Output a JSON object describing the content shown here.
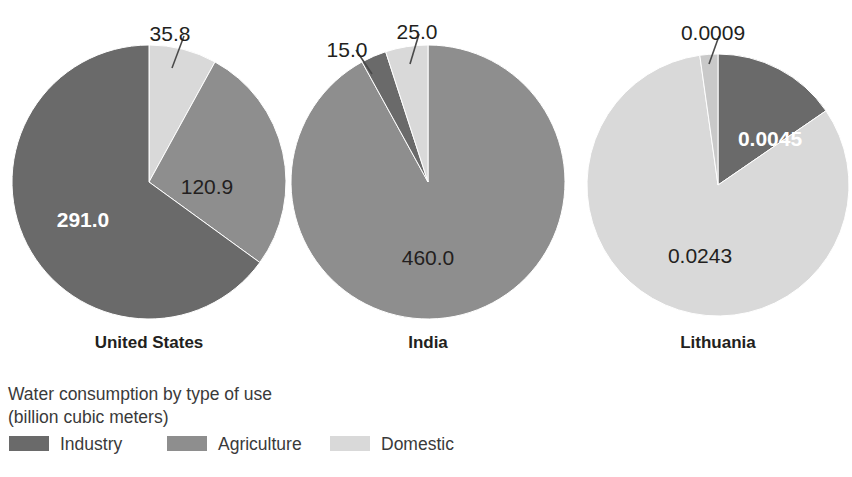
{
  "chart_data": {
    "type": "pie",
    "title": "Water consumption by type of use",
    "subtitle": "(billion cubic meters)",
    "unit": "billion cubic meters",
    "legend": {
      "position": "bottom-left",
      "entries": [
        {
          "name": "Industry",
          "color": "#6a6a6a"
        },
        {
          "name": "Agriculture",
          "color": "#8e8e8e"
        },
        {
          "name": "Domestic",
          "color": "#d9d9d9"
        }
      ]
    },
    "charts": [
      {
        "title": "United States",
        "categories": [
          "Industry",
          "Agriculture",
          "Domestic"
        ],
        "values": [
          291.0,
          120.9,
          35.8
        ],
        "labels": [
          "291.0",
          "120.9",
          "35.8"
        ]
      },
      {
        "title": "India",
        "categories": [
          "Industry",
          "Agriculture",
          "Domestic"
        ],
        "values": [
          15.0,
          460.0,
          25.0
        ],
        "labels": [
          "15.0",
          "460.0",
          "25.0"
        ]
      },
      {
        "title": "Lithuania",
        "categories": [
          "Industry",
          "Agriculture",
          "Domestic"
        ],
        "values": [
          0.0045,
          0.0243,
          0.0009
        ],
        "labels": [
          "0.0045",
          "0.0243",
          "0.0009"
        ]
      }
    ]
  },
  "colors": {
    "industry": "#6a6a6a",
    "agriculture": "#8e8e8e",
    "domestic": "#d9d9d9",
    "text": "#231f20",
    "legend_text": "#3a3a3a",
    "background": "#ffffff",
    "leader_line": "#4a4a4a"
  },
  "pies": [
    {
      "id": "united-states",
      "country": "United States",
      "cx": 149,
      "cy": 182,
      "r": 137,
      "country_label_x": 149,
      "country_label_y": 348,
      "slices": [
        {
          "category": "Domestic",
          "label": "35.8",
          "value": 35.8,
          "color": "#d9d9d9",
          "start_deg": 0,
          "end_deg": 28.8,
          "label_style": "callout",
          "label_x": 170,
          "label_y": 26,
          "leader": {
            "x1": 184,
            "y1": 36,
            "x2": 172,
            "y2": 68
          }
        },
        {
          "category": "Agriculture",
          "label": "120.9",
          "value": 120.9,
          "color": "#8e8e8e",
          "start_deg": 28.8,
          "end_deg": 126.0,
          "label_style": "inside-light",
          "label_x": 207,
          "label_y": 179
        },
        {
          "category": "Industry",
          "label": "291.0",
          "value": 291.0,
          "color": "#6a6a6a",
          "start_deg": 126.0,
          "end_deg": 360,
          "label_style": "inside-dark",
          "label_x": 83,
          "label_y": 212
        }
      ]
    },
    {
      "id": "india",
      "country": "India",
      "cx": 428,
      "cy": 182,
      "r": 137,
      "country_label_x": 428,
      "country_label_y": 348,
      "slices": [
        {
          "category": "Agriculture",
          "label": "460.0",
          "value": 460.0,
          "color": "#8e8e8e",
          "start_deg": 0,
          "end_deg": 331.2,
          "label_style": "inside-light",
          "label_x": 428,
          "label_y": 250
        },
        {
          "category": "Industry",
          "label": "15.0",
          "value": 15.0,
          "color": "#6a6a6a",
          "start_deg": 331.2,
          "end_deg": 342.0,
          "label_style": "callout",
          "label_x": 347,
          "label_y": 42,
          "leader": {
            "x1": 356,
            "y1": 50,
            "x2": 372,
            "y2": 74
          }
        },
        {
          "category": "Domestic",
          "label": "25.0",
          "value": 25.0,
          "color": "#d9d9d9",
          "start_deg": 342.0,
          "end_deg": 360,
          "label_style": "callout",
          "label_x": 417,
          "label_y": 24,
          "leader": {
            "x1": 419,
            "y1": 34,
            "x2": 410,
            "y2": 64
          }
        }
      ]
    },
    {
      "id": "lithuania",
      "country": "Lithuania",
      "cx": 718,
      "cy": 185,
      "r": 131,
      "country_label_x": 718,
      "country_label_y": 348,
      "slices": [
        {
          "category": "Industry",
          "label": "0.0045",
          "value": 0.0045,
          "color": "#6a6a6a",
          "start_deg": 0,
          "end_deg": 55.5,
          "label_style": "inside-dark",
          "label_x": 770,
          "label_y": 131
        },
        {
          "category": "Agriculture",
          "label": "0.0243",
          "value": 0.0243,
          "color": "#d9d9d9",
          "start_deg": 55.5,
          "end_deg": 352.0,
          "label_style": "inside-light",
          "label_x": 700,
          "label_y": 248
        },
        {
          "category": "Domestic",
          "label": "0.0009",
          "value": 0.0009,
          "color": "#c9c9c9",
          "start_deg": 352.0,
          "end_deg": 360,
          "label_style": "callout",
          "label_x": 713,
          "label_y": 25,
          "leader": {
            "x1": 719,
            "y1": 36,
            "x2": 709,
            "y2": 64
          }
        }
      ]
    }
  ],
  "legend": {
    "title_line1": "Water consumption by type of use",
    "title_line2": "(billion cubic meters)",
    "title_x": 8,
    "title_line1_y": 400,
    "title_line2_y": 423,
    "row_y": 448,
    "swatch_w": 40,
    "swatch_h": 15,
    "entries": [
      {
        "name": "Industry",
        "color": "#6a6a6a",
        "swatch_x": 9,
        "label_x": 60
      },
      {
        "name": "Agriculture",
        "color": "#8e8e8e",
        "swatch_x": 167,
        "label_x": 218
      },
      {
        "name": "Domestic",
        "color": "#d9d9d9",
        "swatch_x": 330,
        "label_x": 381
      }
    ]
  }
}
